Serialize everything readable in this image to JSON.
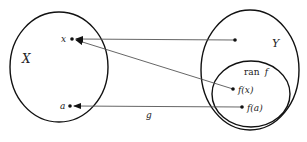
{
  "diagram": {
    "type": "function-mapping",
    "sets": {
      "domain": {
        "label": "X"
      },
      "codomain": {
        "label": "Y"
      },
      "range": {
        "label_prefix": "ran",
        "label_var": "f"
      }
    },
    "points": {
      "x": {
        "label": "x"
      },
      "a": {
        "label": "a"
      },
      "fx": {
        "label": "f(x)"
      },
      "fa": {
        "label": "f(a)"
      }
    },
    "arrows": [
      {
        "from": "point in Y",
        "to": "x",
        "label": ""
      },
      {
        "from": "f(x)",
        "to": "x",
        "label": ""
      },
      {
        "from": "f(a)",
        "to": "a",
        "label": "g"
      }
    ],
    "arrow_label_g": "g",
    "colors": {
      "stroke": "#111111",
      "arrow": "#555555",
      "background": "#ffffff"
    }
  }
}
